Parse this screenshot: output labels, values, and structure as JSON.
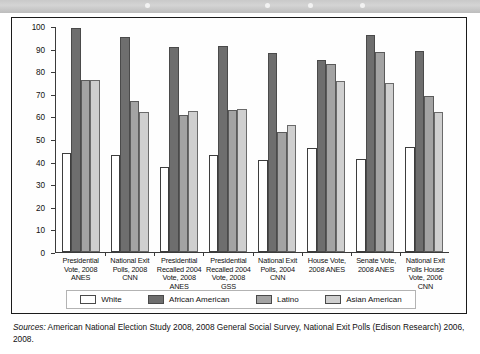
{
  "figure": {
    "source_label": "Sources:",
    "source_text": " American National Election Study 2008, 2008 General Social Survey, National Exit Polls (Edison Research) 2006, 2008."
  },
  "legend": {
    "items": [
      {
        "label": "White",
        "color": "#ffffff",
        "key": "white"
      },
      {
        "label": "African American",
        "color": "#6e6e6e",
        "key": "aa"
      },
      {
        "label": "Latino",
        "color": "#a3a3a3",
        "key": "lat"
      },
      {
        "label": "Asian American",
        "color": "#cfcfcf",
        "key": "asn"
      }
    ]
  },
  "chart_data": {
    "type": "bar",
    "title": "",
    "xlabel": "",
    "ylabel": "",
    "ylim": [
      0,
      100
    ],
    "yticks": [
      0,
      10,
      20,
      30,
      40,
      50,
      60,
      70,
      80,
      90,
      100
    ],
    "grid": false,
    "legend_position": "bottom",
    "categories": [
      "Presidential Vote, 2008 ANES",
      "National Exit Polls, 2008 CNN",
      "Presidential Recalled 2004 Vote, 2008 ANES",
      "Presidential Recalled 2004 Vote, 2008 GSS",
      "National Exit Polls, 2004 CNN",
      "House Vote, 2008 ANES",
      "Senate Vote, 2008 ANES",
      "National Exit Polls House Vote, 2006 CNN"
    ],
    "series": [
      {
        "name": "White",
        "color": "#ffffff",
        "values": [
          44,
          43,
          37.5,
          43,
          40.5,
          46,
          41,
          46.5
        ]
      },
      {
        "name": "African American",
        "color": "#6e6e6e",
        "values": [
          99,
          95,
          90.5,
          91,
          88,
          85,
          96,
          89
        ]
      },
      {
        "name": "Latino",
        "color": "#a3a3a3",
        "values": [
          76,
          67,
          60.5,
          63,
          53,
          83,
          88.5,
          69
        ]
      },
      {
        "name": "Asian American",
        "color": "#cfcfcf",
        "values": [
          76,
          62,
          62.5,
          63.5,
          56,
          75.5,
          75,
          62
        ]
      }
    ]
  }
}
